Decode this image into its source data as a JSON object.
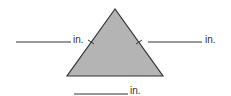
{
  "diagram": {
    "shape": "triangle",
    "fill_color": "#b4b4b4",
    "stroke_color": "#333333",
    "vertices": [
      [
        115,
        9
      ],
      [
        67,
        76
      ],
      [
        163,
        76
      ]
    ],
    "tick_marks": [
      "left-side",
      "right-side"
    ]
  },
  "labels": {
    "left": {
      "blank": "",
      "unit": "in."
    },
    "right": {
      "blank": "",
      "unit": "in."
    },
    "bottom": {
      "blank": "",
      "unit": "in."
    }
  }
}
